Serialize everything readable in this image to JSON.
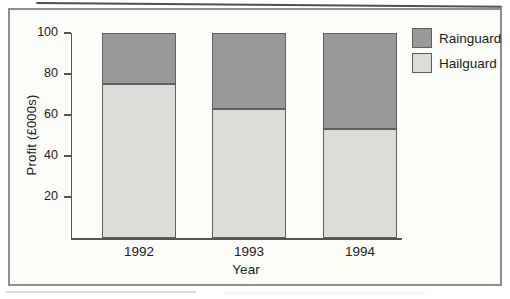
{
  "figure": {
    "frame_border_color": "#8f8f8f",
    "background_color": "#fcfcf9",
    "axis_color": "#555555",
    "text_color": "#222222"
  },
  "chart_data": {
    "type": "bar",
    "stacked": true,
    "title": "",
    "xlabel": "Year",
    "ylabel": "Profit (£000s)",
    "categories": [
      "1992",
      "1993",
      "1994"
    ],
    "series": [
      {
        "name": "Hailguard",
        "color": "#dcdcd8",
        "values": [
          75,
          63,
          53
        ]
      },
      {
        "name": "Rainguard",
        "color": "#999999",
        "values": [
          25,
          37,
          47
        ]
      }
    ],
    "ylim": [
      0,
      100
    ],
    "yticks": [
      20,
      40,
      60,
      80,
      100
    ],
    "legend": [
      {
        "label": "Rainguard",
        "color": "#999999"
      },
      {
        "label": "Hailguard",
        "color": "#dcdcd8"
      }
    ],
    "legend_position": "top-right",
    "grid": false
  }
}
